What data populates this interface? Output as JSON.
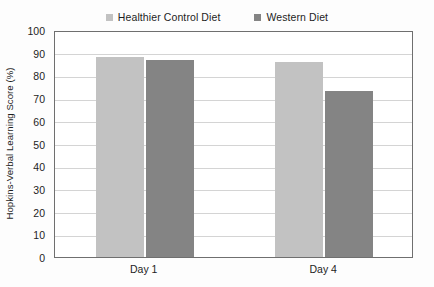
{
  "chart_data": {
    "type": "bar",
    "title": "",
    "xlabel": "",
    "ylabel": "Hopkins-Verbal Learning Score (%)",
    "categories": [
      "Day 1",
      "Day 4"
    ],
    "series": [
      {
        "name": "Healthier Control Diet",
        "values": [
          88,
          86
        ],
        "color": "#c2c2c2"
      },
      {
        "name": "Western Diet",
        "values": [
          87,
          73
        ],
        "color": "#848484"
      }
    ],
    "ylim": [
      0,
      100
    ],
    "yticks": [
      0,
      10,
      20,
      30,
      40,
      50,
      60,
      70,
      80,
      90,
      100
    ],
    "ytick_labels": [
      "0",
      "10",
      "20",
      "30",
      "40",
      "50",
      "60",
      "70",
      "80",
      "90",
      "100"
    ],
    "grid": true,
    "legend_position": "top-center",
    "colors": {
      "grid": "#d4d4d4",
      "axis": "#6f6f6f",
      "text": "#1d1d1d",
      "plot_background": "#ffffff",
      "figure_background": "#fdfdfd"
    }
  },
  "legend": {
    "entries": [
      {
        "label": "Healthier Control Diet",
        "swatch": "#c2c2c2"
      },
      {
        "label": "Western Diet",
        "swatch": "#848484"
      }
    ]
  },
  "axes": {
    "y_title": "Hopkins-Verbal Learning Score (%)"
  }
}
